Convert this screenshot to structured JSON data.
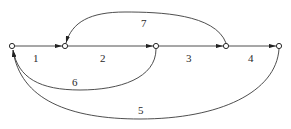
{
  "diagram": {
    "type": "directed-graph",
    "style": {
      "stroke": "#3a3a3a",
      "node_fill": "#ffffff",
      "background": "#ffffff"
    },
    "nodes": [
      {
        "id": "n1",
        "x": 12,
        "y": 46
      },
      {
        "id": "n2",
        "x": 65,
        "y": 46
      },
      {
        "id": "n3",
        "x": 156,
        "y": 46
      },
      {
        "id": "n4",
        "x": 226,
        "y": 46
      },
      {
        "id": "n5",
        "x": 279,
        "y": 46
      }
    ],
    "edges": [
      {
        "label": "1",
        "from": "n1",
        "to": "n2",
        "shape": "straight"
      },
      {
        "label": "2",
        "from": "n2",
        "to": "n3",
        "shape": "straight"
      },
      {
        "label": "3",
        "from": "n3",
        "to": "n4",
        "shape": "straight"
      },
      {
        "label": "4",
        "from": "n4",
        "to": "n5",
        "shape": "straight"
      },
      {
        "label": "5",
        "from": "n5",
        "to": "n1",
        "shape": "arc-below"
      },
      {
        "label": "6",
        "from": "n3",
        "to": "n1",
        "shape": "arc-below"
      },
      {
        "label": "7",
        "from": "n4",
        "to": "n2",
        "shape": "arc-above"
      }
    ]
  }
}
